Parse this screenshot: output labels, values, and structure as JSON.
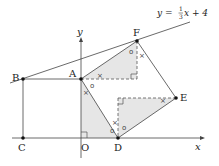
{
  "diagram": {
    "line_equation": {
      "prefix": "y = ",
      "frac_num": "1",
      "frac_den": "3",
      "suffix": "x + 4"
    },
    "axes": {
      "x_label": "x",
      "y_label": "y",
      "origin_label": "O"
    },
    "points": {
      "A": "A",
      "B": "B",
      "C": "C",
      "D": "D",
      "E": "E",
      "F": "F"
    },
    "angle_marks": {
      "cross": "×",
      "circle": "o"
    },
    "colors": {
      "stroke": "#444444",
      "shade": "#e6e6e6",
      "point": "#111111"
    }
  }
}
